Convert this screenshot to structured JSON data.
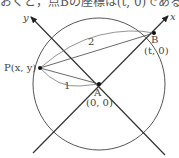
{
  "text_fragment": "おくと，点Bの座標は(t, 0)である。",
  "diagram": {
    "axis_x_label": "x",
    "axis_y_label": "y",
    "point_A_label": "A",
    "point_A_coords": "(0, 0)",
    "point_B_label": "B",
    "point_B_coords": "(t, 0)",
    "point_P_label": "P(x, y)",
    "distance_PA": "1",
    "distance_PB": "2",
    "colors": {
      "line": "#333333",
      "circle": "#555555",
      "curve": "#666666"
    }
  }
}
